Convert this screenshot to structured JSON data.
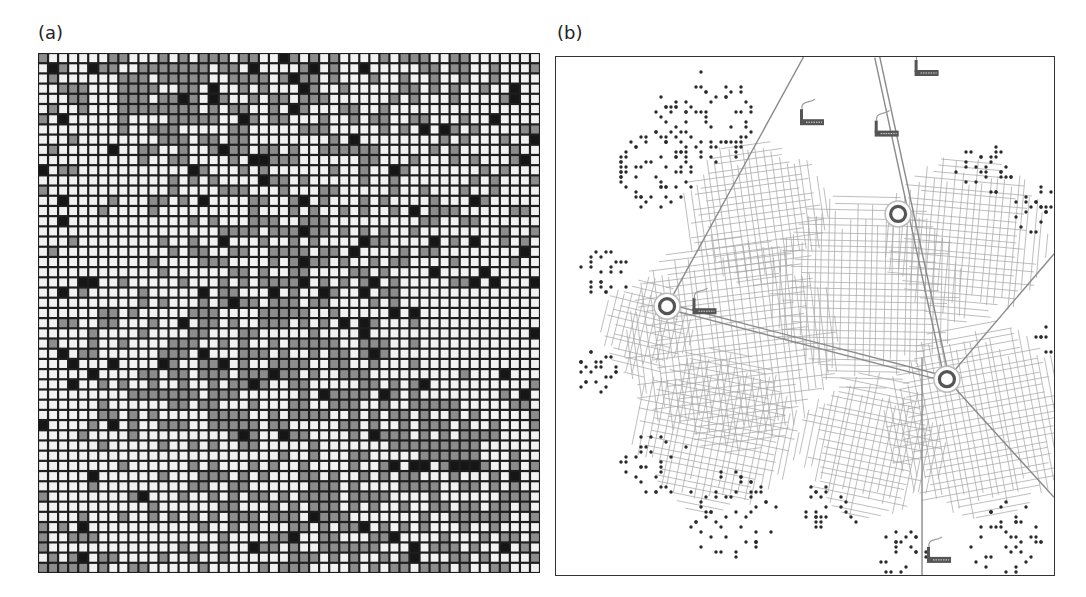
{
  "figure": {
    "panels": [
      {
        "id": "a",
        "label": "(a)",
        "type": "cellular-automaton-grid"
      },
      {
        "id": "b",
        "label": "(b)",
        "type": "urban-growth-map"
      }
    ]
  },
  "grid": {
    "columns": 50,
    "rows": 51,
    "states": {
      "0": {
        "name": "empty",
        "color": "#f2f2f2"
      },
      "1": {
        "name": "developed",
        "color": "#8c8c8c"
      },
      "2": {
        "name": "dense",
        "color": "#161616"
      }
    },
    "line_color": "#1e1e1e",
    "seed": 17,
    "grey_fraction": 0.45,
    "black_fraction": 0.05
  },
  "map": {
    "colors": {
      "road": "#a8a8a8",
      "highway": "#8a8a8a",
      "settlement_dot": "#2a2a2a",
      "hub_outer": "#e8e8e8",
      "hub_ring": "#555555",
      "factory": "#555555"
    },
    "hubs": [
      {
        "name": "hub-west",
        "x": 0.223,
        "y": 0.481
      },
      {
        "name": "hub-north",
        "x": 0.687,
        "y": 0.303
      },
      {
        "name": "hub-east",
        "x": 0.785,
        "y": 0.622
      }
    ],
    "factories": [
      {
        "name": "factory-1",
        "x": 0.49,
        "y": 0.12
      },
      {
        "name": "factory-2",
        "x": 0.64,
        "y": 0.142
      },
      {
        "name": "factory-3",
        "x": 0.72,
        "y": 0.025
      },
      {
        "name": "factory-4",
        "x": 0.274,
        "y": 0.485
      },
      {
        "name": "factory-5",
        "x": 0.745,
        "y": 0.965
      }
    ],
    "highways": [
      {
        "name": "highway-nw",
        "from": [
          0.497,
          0.0
        ],
        "to": [
          0.223,
          0.481
        ],
        "double": false
      },
      {
        "name": "highway-n",
        "from": [
          0.645,
          0.0
        ],
        "to": [
          0.785,
          0.622
        ],
        "double": true
      },
      {
        "name": "highway-w-e",
        "from": [
          0.223,
          0.481
        ],
        "to": [
          0.785,
          0.622
        ],
        "double": true
      },
      {
        "name": "highway-s",
        "from": [
          0.735,
          0.58
        ],
        "to": [
          0.735,
          1.0
        ],
        "double": false
      },
      {
        "name": "highway-se",
        "from": [
          0.785,
          0.622
        ],
        "to": [
          1.0,
          0.85
        ],
        "double": false
      },
      {
        "name": "highway-ne",
        "from": [
          0.785,
          0.622
        ],
        "to": [
          1.0,
          0.38
        ],
        "double": false
      }
    ],
    "urban_clusters": [
      {
        "x": 0.35,
        "y": 0.55,
        "r": 0.22
      },
      {
        "x": 0.62,
        "y": 0.45,
        "r": 0.2
      },
      {
        "x": 0.82,
        "y": 0.35,
        "r": 0.17
      },
      {
        "x": 0.4,
        "y": 0.3,
        "r": 0.15
      },
      {
        "x": 0.32,
        "y": 0.72,
        "r": 0.17
      },
      {
        "x": 0.85,
        "y": 0.7,
        "r": 0.2
      },
      {
        "x": 0.63,
        "y": 0.75,
        "r": 0.15
      },
      {
        "x": 0.18,
        "y": 0.52,
        "r": 0.1
      }
    ],
    "settlement_clusters": [
      {
        "x": 0.3,
        "y": 0.12,
        "r": 0.1,
        "n": 80
      },
      {
        "x": 0.2,
        "y": 0.22,
        "r": 0.08,
        "n": 60
      },
      {
        "x": 0.1,
        "y": 0.42,
        "r": 0.05,
        "n": 25
      },
      {
        "x": 0.08,
        "y": 0.6,
        "r": 0.05,
        "n": 25
      },
      {
        "x": 0.2,
        "y": 0.78,
        "r": 0.07,
        "n": 30
      },
      {
        "x": 0.35,
        "y": 0.88,
        "r": 0.09,
        "n": 55
      },
      {
        "x": 0.55,
        "y": 0.87,
        "r": 0.06,
        "n": 25
      },
      {
        "x": 0.7,
        "y": 0.97,
        "r": 0.06,
        "n": 25
      },
      {
        "x": 0.9,
        "y": 0.93,
        "r": 0.08,
        "n": 40
      },
      {
        "x": 0.86,
        "y": 0.22,
        "r": 0.06,
        "n": 30
      },
      {
        "x": 0.97,
        "y": 0.3,
        "r": 0.05,
        "n": 30
      },
      {
        "x": 0.99,
        "y": 0.55,
        "r": 0.03,
        "n": 10
      }
    ]
  }
}
